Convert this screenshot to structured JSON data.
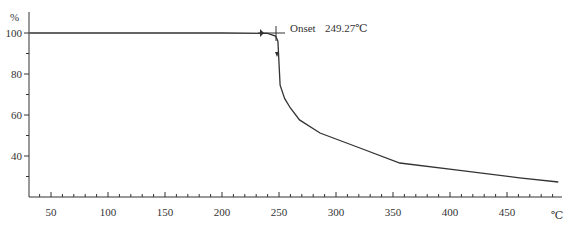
{
  "chart_data": {
    "type": "line",
    "title": "",
    "xlabel": "°C",
    "ylabel": "%",
    "xlim": [
      31,
      500
    ],
    "ylim": [
      22,
      108
    ],
    "x_ticks": [
      50,
      100,
      150,
      200,
      250,
      300,
      350,
      400,
      450
    ],
    "y_ticks": [
      40,
      60,
      80,
      100
    ],
    "grid": false,
    "legend": null,
    "series": [
      {
        "name": "TGA mass loss",
        "x": [
          31,
          100,
          200,
          240,
          247,
          249,
          251,
          255,
          260,
          268,
          286,
          321,
          356,
          405,
          461,
          495
        ],
        "y": [
          100,
          100,
          100,
          99.8,
          98.5,
          96,
          74.6,
          68,
          63.4,
          57.6,
          51.2,
          43.9,
          36.6,
          33.2,
          29.3,
          27.3
        ]
      }
    ],
    "annotations": [
      {
        "label": "Onset",
        "value": "249.27℃",
        "x": 249.27,
        "y": 100
      }
    ]
  },
  "labels": {
    "y_unit": "%",
    "x_unit": "℃",
    "onset_label": "Onset",
    "onset_value": "249.27℃",
    "x_tick_labels": [
      "50",
      "100",
      "150",
      "200",
      "250",
      "300",
      "350",
      "400",
      "450"
    ],
    "y_tick_labels": [
      "100",
      "80",
      "60",
      "40"
    ]
  }
}
